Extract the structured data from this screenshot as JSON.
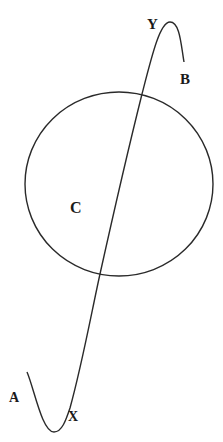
{
  "diagram": {
    "labels": {
      "A": "A",
      "B": "B",
      "C": "C",
      "X": "X",
      "Y": "Y"
    },
    "stroke_color": "#2a2a2a",
    "background": "#ffffff"
  }
}
